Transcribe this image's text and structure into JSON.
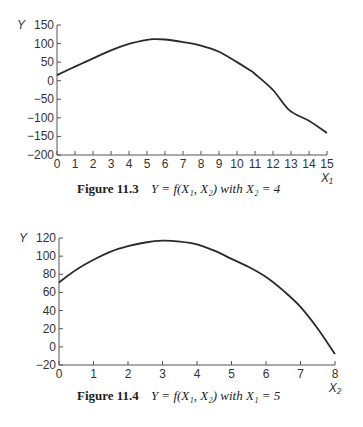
{
  "chart_data": [
    {
      "type": "line",
      "title": "Figure 11.3",
      "caption_label": "Figure 11.3",
      "caption_text": "Y = f(X₁, X₂) with X₂ = 4",
      "xlabel": "X₁",
      "ylabel": "Y",
      "xlim": [
        0,
        15
      ],
      "ylim": [
        -200,
        150
      ],
      "xticks": [
        0,
        1,
        2,
        3,
        4,
        5,
        6,
        7,
        8,
        9,
        10,
        11,
        12,
        13,
        14,
        15
      ],
      "yticks": [
        150,
        100,
        50,
        0,
        -50,
        -100,
        -150,
        -200
      ],
      "grid": false,
      "series": [
        {
          "name": "Y",
          "x": [
            0,
            1,
            2,
            2.4,
            3,
            4,
            5,
            5.4,
            6,
            7,
            7.9,
            9,
            10,
            10.7,
            11,
            12,
            12.9,
            14,
            15
          ],
          "values": [
            15,
            38,
            60,
            69,
            82,
            99,
            110,
            112,
            111,
            104,
            96,
            78,
            50,
            29,
            18,
            -25,
            -79,
            -108,
            -141
          ]
        }
      ]
    },
    {
      "type": "line",
      "title": "Figure 11.4",
      "caption_label": "Figure 11.4",
      "caption_text": "Y = f(X₁, X₂) with X₁ = 5",
      "xlabel": "X₂",
      "ylabel": "Y",
      "xlim": [
        0,
        8
      ],
      "ylim": [
        -20,
        120
      ],
      "xticks": [
        0,
        1,
        2,
        3,
        4,
        5,
        6,
        7,
        8
      ],
      "yticks": [
        120,
        100,
        80,
        60,
        40,
        20,
        0,
        -20
      ],
      "grid": false,
      "series": [
        {
          "name": "Y",
          "x": [
            0,
            0.5,
            1,
            1.5,
            2,
            2.5,
            3,
            3.5,
            4,
            4.5,
            5,
            5.5,
            6,
            6.5,
            7,
            7.5,
            8
          ],
          "values": [
            71,
            85,
            96,
            105,
            111,
            115,
            117,
            116,
            113,
            106,
            97,
            88,
            77,
            62,
            44,
            20,
            -8
          ]
        }
      ]
    }
  ],
  "figures": [
    {
      "label": "Figure 11.3",
      "equation": "Y = f(X₁, X₂) with X₂ = 4"
    },
    {
      "label": "Figure 11.4",
      "equation": "Y = f(X₁, X₂) with X₁ = 5"
    }
  ]
}
